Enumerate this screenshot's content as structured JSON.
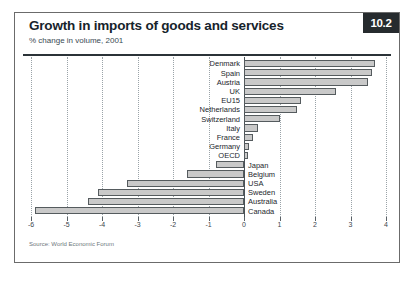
{
  "header": {
    "title": "Growth in imports of goods and services",
    "subtitle": "% change in volume, 2001",
    "badge": "10.2"
  },
  "source": "Source: World Economic Forum",
  "colors": {
    "bar_fill": "#c9c9c9",
    "bar_stroke": "#555b5e",
    "badge_bg": "#262b2e",
    "frame": "#6b6b6b",
    "grid": "#9aa3a8"
  },
  "chart_data": {
    "type": "bar",
    "orientation": "horizontal",
    "title": "Growth in imports of goods and services",
    "subtitle": "% change in volume, 2001",
    "xlabel": "",
    "ylabel": "",
    "xlim": [
      -6,
      4
    ],
    "xticks": [
      -6,
      -5,
      -4,
      -3,
      -2,
      -1,
      0,
      1,
      2,
      3,
      4
    ],
    "xtick_labels": [
      "-6",
      "-5",
      "-4",
      "-3",
      "-2",
      "-1",
      "0",
      "1",
      "2",
      "3",
      "4"
    ],
    "grid": true,
    "legend": "none",
    "categories": [
      "Denmark",
      "Spain",
      "Austria",
      "UK",
      "EU15",
      "Netherlands",
      "Switzerland",
      "Italy",
      "France",
      "Germany",
      "OECD",
      "Japan",
      "Belgium",
      "USA",
      "Sweden",
      "Australia",
      "Canada"
    ],
    "values": [
      3.7,
      3.6,
      3.5,
      2.6,
      1.6,
      1.5,
      1.0,
      0.4,
      0.25,
      0.15,
      0.1,
      -0.8,
      -1.6,
      -3.3,
      -4.1,
      -4.4,
      -5.9
    ]
  }
}
